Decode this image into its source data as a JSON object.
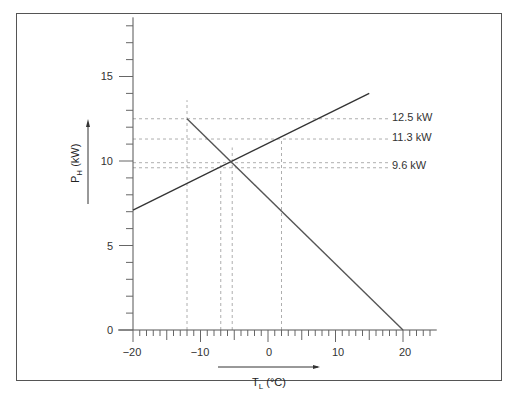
{
  "chart_data": {
    "type": "line",
    "title": "",
    "xlabel": "T_L (°C)",
    "ylabel": "P_H (kW)",
    "xlim": [
      -20,
      25
    ],
    "ylim": [
      0,
      18.5
    ],
    "x_ticks": [
      -20,
      -10,
      0,
      10,
      20
    ],
    "y_ticks": [
      0,
      5,
      10,
      15
    ],
    "grid": false,
    "series": [
      {
        "name": "rising line (heating capacity)",
        "x": [
          -20,
          15
        ],
        "y": [
          7.1,
          14.0
        ]
      },
      {
        "name": "falling line (heat demand)",
        "x": [
          -12,
          20
        ],
        "y": [
          12.5,
          0
        ]
      }
    ],
    "reference_lines": {
      "horizontal": [
        12.5,
        11.3,
        9.9,
        9.6
      ],
      "vertical": [
        -12,
        -7,
        -5.3,
        2
      ]
    },
    "annotations": [
      {
        "text": "12.5 kW",
        "y": 12.5
      },
      {
        "text": "11.3 kW",
        "y": 11.3
      },
      {
        "text": "9.6 kW",
        "y": 9.6
      }
    ]
  },
  "labels": {
    "y_ticks": [
      "0",
      "5",
      "10",
      "15"
    ],
    "x_ticks": [
      "−20",
      "−10",
      "0",
      "10",
      "20"
    ],
    "ylabel_main": "P",
    "ylabel_sub": "H",
    "ylabel_unit": " (kW)",
    "xlabel_main": "T",
    "xlabel_sub": "L",
    "xlabel_unit": " (°C)",
    "ann_1": "12.5 kW",
    "ann_2": "11.3 kW",
    "ann_3": "9.6 kW"
  }
}
